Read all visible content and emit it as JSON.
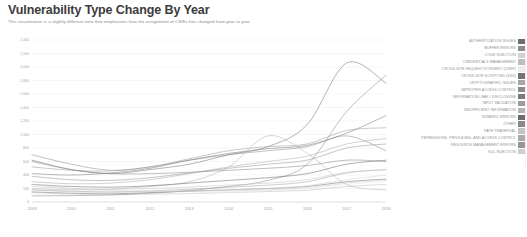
{
  "header": {
    "title": "Vulnerability Type Change By Year",
    "subtitle": "This visualization is a slightly different view that emphasizes how the assignment of CWEs has changed from year to year"
  },
  "legend": {
    "position": "right",
    "items": [
      {
        "label": "AUTHENTICATION ISSUES",
        "color": "#6f6f6f"
      },
      {
        "label": "BUFFER ERRORS",
        "color": "#8e8e8e"
      },
      {
        "label": "CODE INJECTION",
        "color": "#d2d2d2"
      },
      {
        "label": "CREDENTIALS MANAGEMENT",
        "color": "#bdbdbd"
      },
      {
        "label": "CROSS-SITE REQUEST FORGERY (CSRF)",
        "color": "#ececec"
      },
      {
        "label": "CROSS-SITE SCRIPTING (XSS)",
        "color": "#747474"
      },
      {
        "label": "CRYPTOGRAPHIC ISSUES",
        "color": "#a6a6a6"
      },
      {
        "label": "IMPROPER ACCESS CONTROL",
        "color": "#8a8a8a"
      },
      {
        "label": "INFORMATION LEAK / DISCLOSURE",
        "color": "#7b7b7b"
      },
      {
        "label": "INPUT VALIDATION",
        "color": "#9c9c9c"
      },
      {
        "label": "INSUFFICIENT INFORMATION",
        "color": "#b4b4b4"
      },
      {
        "label": "NUMERIC ERRORS",
        "color": "#6b6b6b"
      },
      {
        "label": "OTHER",
        "color": "#888888"
      },
      {
        "label": "PATH TRAVERSAL",
        "color": "#c4c4c4"
      },
      {
        "label": "PERMISSIONS, PRIVILEGES, AND ACCESS CONTROL",
        "color": "#ababab"
      },
      {
        "label": "RESOURCE MANAGEMENT ERRORS",
        "color": "#959595"
      },
      {
        "label": "SQL INJECTION",
        "color": "#cfcfcf"
      }
    ]
  },
  "chart_data": {
    "type": "line",
    "title": "Vulnerability Type Change By Year",
    "xlabel": "",
    "ylabel": "",
    "grid": true,
    "legend_position": "right",
    "x": [
      2009,
      2010,
      2011,
      2012,
      2013,
      2014,
      2015,
      2016,
      2017,
      2018
    ],
    "xticklabels": [
      "2009",
      "2010",
      "2011",
      "2012",
      "2013",
      "2014",
      "2015",
      "2016",
      "2017",
      "2018"
    ],
    "ylim": [
      0,
      2400
    ],
    "yticks": [
      0,
      200,
      400,
      600,
      800,
      1000,
      1200,
      1400,
      1600,
      1800,
      2000,
      2200,
      2400
    ],
    "yticklabels": [
      "0",
      "200",
      "400",
      "600",
      "800",
      "1,000",
      "1,200",
      "1,400",
      "1,600",
      "1,800",
      "2,000",
      "2,200",
      "2,400"
    ],
    "series": [
      {
        "name": "AUTHENTICATION ISSUES",
        "color": "#6f6f6f",
        "values": [
          150,
          130,
          120,
          140,
          160,
          180,
          200,
          230,
          300,
          340
        ]
      },
      {
        "name": "BUFFER ERRORS",
        "color": "#8e8e8e",
        "values": [
          700,
          560,
          470,
          520,
          620,
          700,
          760,
          820,
          980,
          760
        ]
      },
      {
        "name": "CODE INJECTION",
        "color": "#d2d2d2",
        "values": [
          180,
          150,
          140,
          150,
          165,
          180,
          200,
          240,
          330,
          400
        ]
      },
      {
        "name": "CREDENTIALS MANAGEMENT",
        "color": "#bdbdbd",
        "values": [
          140,
          120,
          110,
          115,
          125,
          140,
          155,
          175,
          230,
          260
        ]
      },
      {
        "name": "CROSS-SITE REQUEST FORGERY (CSRF)",
        "color": "#ececec",
        "values": [
          120,
          110,
          105,
          115,
          130,
          150,
          170,
          200,
          260,
          300
        ]
      },
      {
        "name": "CROSS-SITE SCRIPTING (XSS)",
        "color": "#747474",
        "values": [
          620,
          480,
          420,
          480,
          560,
          700,
          820,
          1150,
          2060,
          1760
        ]
      },
      {
        "name": "CRYPTOGRAPHIC ISSUES",
        "color": "#a6a6a6",
        "values": [
          180,
          160,
          150,
          165,
          190,
          220,
          250,
          300,
          430,
          480
        ]
      },
      {
        "name": "IMPROPER ACCESS CONTROL",
        "color": "#8a8a8a",
        "values": [
          90,
          95,
          105,
          130,
          170,
          230,
          320,
          560,
          1340,
          1880
        ]
      },
      {
        "name": "INFORMATION LEAK / DISCLOSURE",
        "color": "#7b7b7b",
        "values": [
          420,
          400,
          430,
          500,
          620,
          720,
          790,
          840,
          1020,
          1280
        ]
      },
      {
        "name": "INPUT VALIDATION",
        "color": "#9c9c9c",
        "values": [
          520,
          470,
          460,
          520,
          640,
          760,
          820,
          860,
          1060,
          1100
        ]
      },
      {
        "name": "INSUFFICIENT INFORMATION",
        "color": "#b4b4b4",
        "values": [
          200,
          180,
          190,
          230,
          300,
          520,
          980,
          720,
          260,
          180
        ]
      },
      {
        "name": "NUMERIC ERRORS",
        "color": "#6b6b6b",
        "values": [
          260,
          230,
          220,
          240,
          280,
          320,
          360,
          420,
          560,
          620
        ]
      },
      {
        "name": "OTHER",
        "color": "#888888",
        "values": [
          600,
          480,
          420,
          420,
          440,
          470,
          500,
          540,
          620,
          600
        ]
      },
      {
        "name": "PATH TRAVERSAL",
        "color": "#c4c4c4",
        "values": [
          230,
          200,
          190,
          200,
          220,
          250,
          280,
          330,
          440,
          480
        ]
      },
      {
        "name": "PERMISSIONS, PRIVILEGES, AND ACCESS CONTROL",
        "color": "#ababab",
        "values": [
          300,
          270,
          280,
          330,
          420,
          520,
          600,
          680,
          860,
          940
        ]
      },
      {
        "name": "RESOURCE MANAGEMENT ERRORS",
        "color": "#959595",
        "values": [
          380,
          330,
          320,
          360,
          430,
          500,
          560,
          620,
          800,
          860
        ]
      },
      {
        "name": "SQL INJECTION",
        "color": "#cfcfcf",
        "values": [
          260,
          200,
          170,
          160,
          160,
          165,
          180,
          210,
          280,
          320
        ]
      }
    ]
  }
}
